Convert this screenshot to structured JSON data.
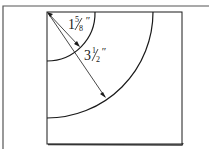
{
  "diagram": {
    "type": "quarter-circle templates on square",
    "labels": {
      "small_radius": "1⅝″",
      "small_whole": "1",
      "small_num": "5",
      "small_den": "8",
      "large_radius": "3½″",
      "large_whole": "3",
      "large_num": "1",
      "large_den": "2",
      "inch_mark": "″"
    },
    "colors": {
      "line": "#1a1a1a",
      "frame": "#555555",
      "background": "#ffffff"
    }
  }
}
